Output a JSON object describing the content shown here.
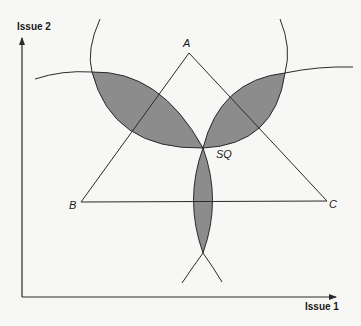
{
  "diagram": {
    "axes": {
      "x_label": "Issue 1",
      "y_label": "Issue 2"
    },
    "points": {
      "A": "A",
      "B": "B",
      "C": "C",
      "SQ": "SQ"
    },
    "colors": {
      "background": "#f7f7f5",
      "line": "#2a2a2a",
      "shade": "#8c8c8c"
    }
  }
}
